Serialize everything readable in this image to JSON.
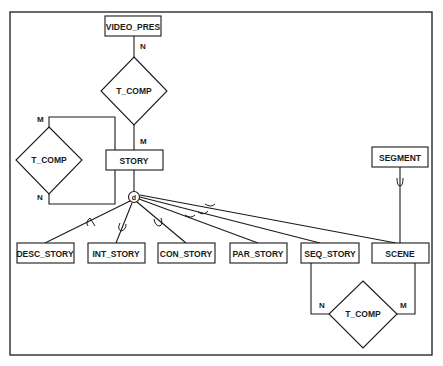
{
  "diagram": {
    "type": "entity-relationship",
    "entities": [
      {
        "id": "video_pres",
        "label": "VIDEO_PRES",
        "x": 105,
        "y": 16,
        "w": 56,
        "h": 20
      },
      {
        "id": "story",
        "label": "STORY",
        "x": 106,
        "y": 150,
        "w": 57,
        "h": 20
      },
      {
        "id": "segment",
        "label": "SEGMENT",
        "x": 372,
        "y": 147,
        "w": 56,
        "h": 20
      },
      {
        "id": "desc_story",
        "label": "DESC_STORY",
        "x": 17,
        "y": 243,
        "w": 57,
        "h": 20
      },
      {
        "id": "int_story",
        "label": "INT_STORY",
        "x": 88,
        "y": 243,
        "w": 57,
        "h": 20
      },
      {
        "id": "con_story",
        "label": "CON_STORY",
        "x": 158,
        "y": 243,
        "w": 57,
        "h": 20
      },
      {
        "id": "par_story",
        "label": "PAR_STORY",
        "x": 230,
        "y": 243,
        "w": 57,
        "h": 20
      },
      {
        "id": "seq_story",
        "label": "SEQ_STORY",
        "x": 301,
        "y": 243,
        "w": 58,
        "h": 20
      },
      {
        "id": "scene",
        "label": "SCENE",
        "x": 372,
        "y": 243,
        "w": 57,
        "h": 20
      }
    ],
    "relationships": [
      {
        "id": "rel_top",
        "label": "T_COMP",
        "cx": 134,
        "cy": 91,
        "from": "VIDEO_PRES",
        "from_card": "N",
        "to": "STORY",
        "to_card": "M"
      },
      {
        "id": "rel_left",
        "label": "T_COMP",
        "cx": 49,
        "cy": 160,
        "from": "STORY",
        "from_card": "M",
        "to": "STORY",
        "to_card": "N"
      },
      {
        "id": "rel_bottom",
        "label": "T_COMP",
        "cx": 363,
        "cy": 314,
        "from": "SEQ_STORY",
        "from_card": "N",
        "to": "SCENE",
        "to_card": "M"
      }
    ],
    "cardinalities": {
      "top_n": "N",
      "top_m": "M",
      "left_m": "M",
      "left_n": "N",
      "bottom_n": "N",
      "bottom_m": "M"
    },
    "specialization": {
      "symbol": "d",
      "parent": "STORY",
      "children": [
        "DESC_STORY",
        "INT_STORY",
        "CON_STORY",
        "PAR_STORY",
        "SEQ_STORY",
        "SCENE"
      ],
      "subset_symbol": "⊂"
    },
    "segment_link": {
      "from": "SEGMENT",
      "to": "SCENE",
      "symbol": "⊂"
    }
  }
}
